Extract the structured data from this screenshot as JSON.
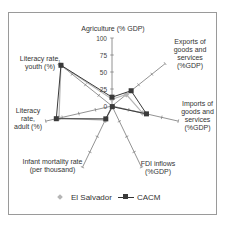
{
  "chart_data": {
    "type": "radar",
    "title": "",
    "axes": [
      "Agriculture (% GDP)",
      "Exports of goods and services (%GDP)",
      "Imports of goods and services (%GDP)",
      "FDI inflows (%GDP)",
      "Infant mortality rate (per thousand)",
      "Literacy rate, adult (%)",
      "Literacy rate, youth (%)"
    ],
    "axis_labels_display": [
      "Agriculture (% GDP)",
      "Exports of\ngoods and\nservices\n(%GDP)",
      "Imports of\ngoods and\nservices\n(%GDP)",
      "FDI inflows\n(%GDP)",
      "Infant mortality rate\n(per thousand)",
      "Literacy\nrate,\nadult (%)",
      "Literacy rate,\nyouth (%)"
    ],
    "radial_ticks": [
      0,
      25,
      50,
      75,
      100
    ],
    "range": [
      0,
      100
    ],
    "series": [
      {
        "name": "El Salvador",
        "marker": "diamond",
        "color": "#b5b5b5",
        "values": [
          10,
          27,
          46,
          1,
          23,
          80,
          96
        ]
      },
      {
        "name": "CACM",
        "marker": "square",
        "color": "#3a3a3a",
        "values": [
          13,
          36,
          52,
          1,
          21,
          84,
          96
        ]
      }
    ],
    "legend_position": "bottom",
    "grid": false
  },
  "legend": {
    "el_salvador": "El Salvador",
    "cacm": "CACM"
  },
  "ticks": [
    "100",
    "75",
    "50",
    "25",
    "0"
  ]
}
